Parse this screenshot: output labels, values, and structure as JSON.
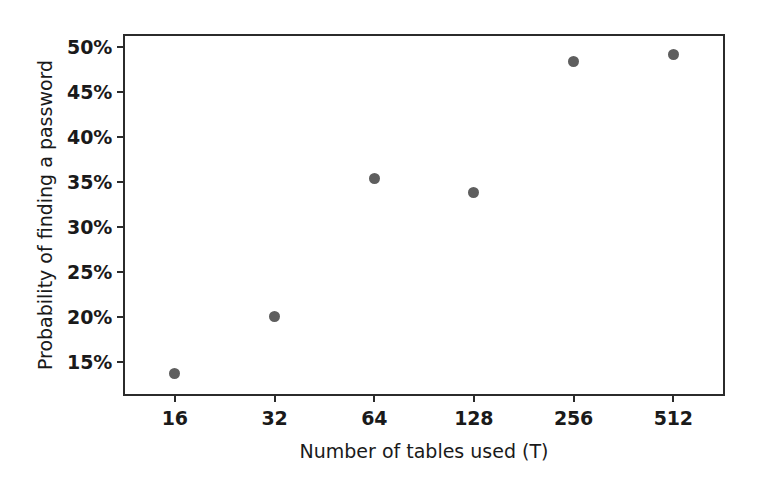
{
  "chart_data": {
    "type": "scatter",
    "title": "",
    "xlabel": "Number of tables used (T)",
    "ylabel": "Probability of finding a password",
    "x_tick_labels": [
      "16",
      "32",
      "64",
      "128",
      "256",
      "512"
    ],
    "x_tick_values": [
      16,
      32,
      64,
      128,
      256,
      512
    ],
    "x_scale": "log2-categorical",
    "y_tick_labels": [
      "50%",
      "45%",
      "40%",
      "35%",
      "30%",
      "25%",
      "20%",
      "15%"
    ],
    "y_tick_values": [
      50,
      45,
      40,
      35,
      30,
      25,
      20,
      15
    ],
    "ylim": [
      11.5,
      51.2
    ],
    "grid": false,
    "legend": null,
    "marker": {
      "shape": "circle",
      "color": "#5e5e5e",
      "size_px": 11
    },
    "points": [
      {
        "x_label": "16",
        "x": 16,
        "y": 13.8
      },
      {
        "x_label": "32",
        "x": 32,
        "y": 20.1
      },
      {
        "x_label": "64",
        "x": 64,
        "y": 35.4
      },
      {
        "x_label": "128",
        "x": 128,
        "y": 33.9
      },
      {
        "x_label": "256",
        "x": 256,
        "y": 48.4
      },
      {
        "x_label": "512",
        "x": 512,
        "y": 49.2
      }
    ],
    "values": [
      13.8,
      20.1,
      35.4,
      33.9,
      48.4,
      49.2
    ],
    "categories": [
      "16",
      "32",
      "64",
      "128",
      "256",
      "512"
    ],
    "colors": {
      "marker": "#5e5e5e",
      "axis": "#2b2b2b",
      "text": "#1a1a1a",
      "background": "#ffffff"
    }
  }
}
